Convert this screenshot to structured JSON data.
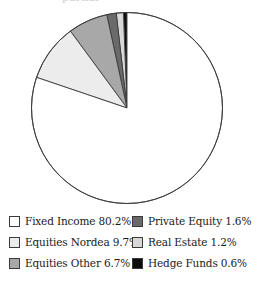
{
  "chart_data": {
    "type": "pie",
    "title": "",
    "xlabel": "",
    "ylabel": "",
    "legend_position": "bottom",
    "grid": false,
    "start_angle_deg": 90,
    "direction": "counterclockwise",
    "categories": [
      "Hedge Funds",
      "Real Estate",
      "Private Equity",
      "Equities Other",
      "Equities Nordea",
      "Fixed Income"
    ],
    "values": [
      0.6,
      1.2,
      1.6,
      6.7,
      9.7,
      80.2
    ],
    "slices": [
      {
        "label": "Hedge Funds",
        "value": 0.6,
        "value_label": "0.6%",
        "color": "#0d0d0d"
      },
      {
        "label": "Real Estate",
        "value": 1.2,
        "value_label": "1.2%",
        "color": "#d8d8d8"
      },
      {
        "label": "Private Equity",
        "value": 1.6,
        "value_label": "1.6%",
        "color": "#6a6a6a"
      },
      {
        "label": "Equities Other",
        "value": 6.7,
        "value_label": "6.7%",
        "color": "#a8a8a8"
      },
      {
        "label": "Equities Nordea",
        "value": 9.7,
        "value_label": "9.7%",
        "color": "#ececec"
      },
      {
        "label": "Fixed Income",
        "value": 80.2,
        "value_label": "80.2%",
        "color": "#ffffff"
      }
    ],
    "stroke_color": "#3a3a3a"
  },
  "legend": {
    "columns": [
      {
        "entries": [
          {
            "text": "Fixed Income 80.2%",
            "swatch": "#ffffff",
            "name": "legend-fixed-income"
          },
          {
            "text": "Equities Nordea 9.7%",
            "swatch": "#ececec",
            "name": "legend-equities-nordea"
          },
          {
            "text": "Equities Other 6.7%",
            "swatch": "#a8a8a8",
            "name": "legend-equities-other"
          }
        ]
      },
      {
        "entries": [
          {
            "text": "Private Equity 1.6%",
            "swatch": "#6a6a6a",
            "name": "legend-private-equity"
          },
          {
            "text": "Real Estate 1.2%",
            "swatch": "#d8d8d8",
            "name": "legend-real-estate"
          },
          {
            "text": "Hedge Funds 0.6%",
            "swatch": "#0d0d0d",
            "name": "legend-hedge-funds"
          }
        ]
      }
    ]
  },
  "title_crop": {
    "text": "partial"
  }
}
